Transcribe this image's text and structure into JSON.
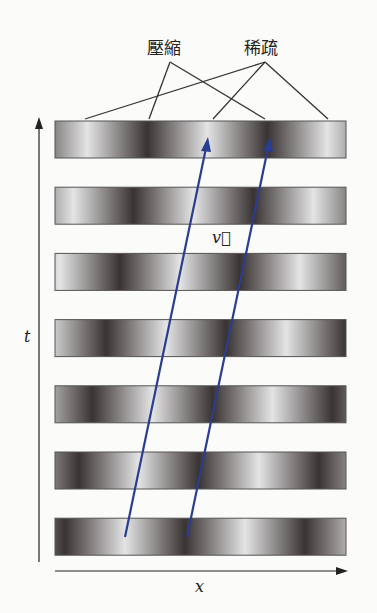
{
  "labels": {
    "compression": "壓縮",
    "rarefaction": "稀疏",
    "velocity": "v⃗",
    "time_axis": "t",
    "space_axis": "x"
  },
  "diagram": {
    "bar_count": 7,
    "wave_period_bars": 2.4,
    "shift_per_bar_fraction": 0.114,
    "colors": {
      "arrow": "#2a3d8f",
      "line": "#333333",
      "dark": "#3a3333",
      "light": "#e4e4e4"
    }
  }
}
